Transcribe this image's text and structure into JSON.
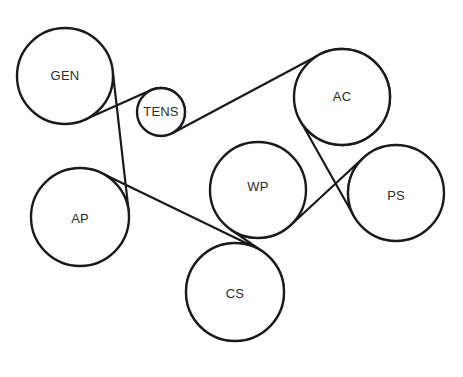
{
  "diagram": {
    "title": "Serpentine Belt Routing Diagram",
    "type": "belt-routing",
    "canvas": {
      "width": 463,
      "height": 377,
      "background": "#ffffff"
    },
    "stroke_color": "#1a1a1a",
    "label_color": "#2b2b2b",
    "pulley_stroke_width": 2.4,
    "belt_stroke_width": 2.2,
    "pulleys": [
      {
        "id": "gen",
        "label": "GEN",
        "cx": 65,
        "cy": 76,
        "r": 48,
        "label_dx": 0,
        "label_dy": 1
      },
      {
        "id": "tens",
        "label": "TENS",
        "cx": 161,
        "cy": 112,
        "r": 24,
        "label_dx": 0,
        "label_dy": 1
      },
      {
        "id": "ac",
        "label": "AC",
        "cx": 342,
        "cy": 97,
        "r": 48,
        "label_dx": 0,
        "label_dy": 1
      },
      {
        "id": "ps",
        "label": "PS",
        "cx": 396,
        "cy": 193,
        "r": 48,
        "label_dx": 0,
        "label_dy": 4
      },
      {
        "id": "wp",
        "label": "WP",
        "cx": 258,
        "cy": 190,
        "r": 48,
        "label_dx": 0,
        "label_dy": -2
      },
      {
        "id": "cs",
        "label": "CS",
        "cx": 235,
        "cy": 292,
        "r": 49,
        "label_dx": 0,
        "label_dy": 3
      },
      {
        "id": "ap",
        "label": "AP",
        "cx": 80,
        "cy": 217,
        "r": 49,
        "label_dx": 0,
        "label_dy": 3
      }
    ],
    "belt_route": [
      {
        "from": "gen",
        "to": "tens",
        "type": "cross"
      },
      {
        "from": "tens",
        "to": "ac",
        "type": "cross"
      },
      {
        "from": "ac",
        "to": "ps",
        "type": "outer"
      },
      {
        "from": "ps",
        "to": "wp",
        "type": "cross"
      },
      {
        "from": "wp",
        "to": "cs",
        "type": "cross"
      },
      {
        "from": "cs",
        "to": "ap",
        "type": "outer"
      },
      {
        "from": "ap",
        "to": "gen",
        "type": "outer"
      }
    ]
  }
}
